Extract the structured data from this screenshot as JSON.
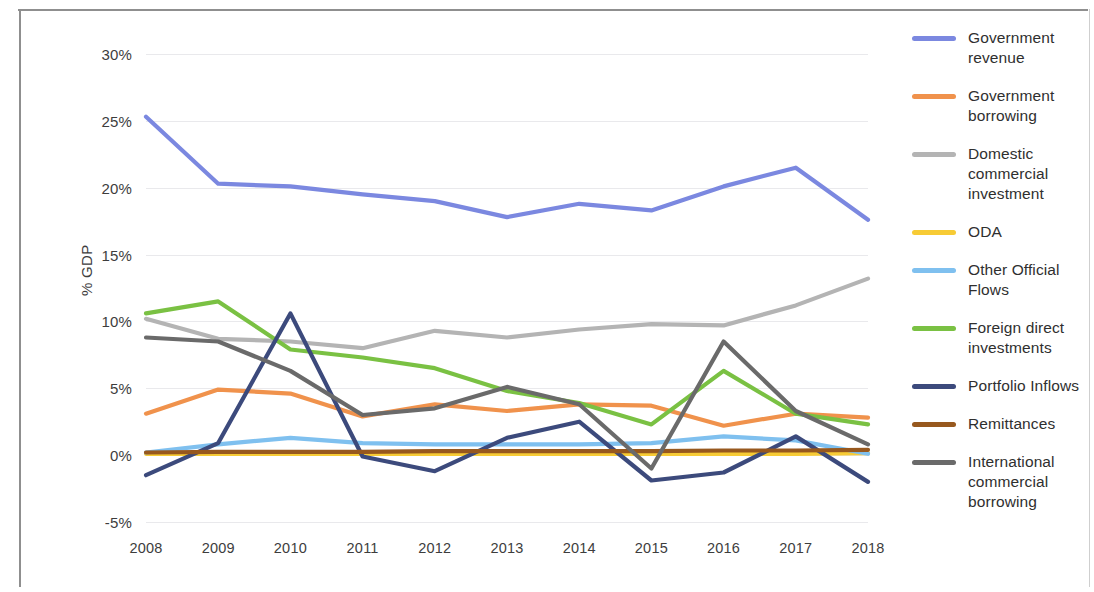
{
  "chart_data": {
    "type": "line",
    "title": "",
    "xlabel": "",
    "ylabel": "% GDP",
    "x": [
      2008,
      2009,
      2010,
      2011,
      2012,
      2013,
      2014,
      2015,
      2016,
      2017,
      2018
    ],
    "xticklabels": [
      "2008",
      "2009",
      "2010",
      "2011",
      "2012",
      "2013",
      "2014",
      "2015",
      "2016",
      "2017",
      "2018"
    ],
    "yticklabels": [
      "30%",
      "25%",
      "20%",
      "15%",
      "10%",
      "5%",
      "0%",
      "-5%"
    ],
    "yticks": [
      30,
      25,
      20,
      15,
      10,
      5,
      0,
      -5
    ],
    "ylim": [
      -5,
      30
    ],
    "grid": true,
    "legend_position": "right",
    "series": [
      {
        "name": "Government revenue",
        "color": "#7b88e0",
        "values": [
          25.3,
          20.3,
          20.1,
          19.5,
          19.0,
          17.8,
          18.8,
          18.3,
          20.1,
          21.5,
          17.6
        ]
      },
      {
        "name": "Government borrowing",
        "color": "#f0924c",
        "values": [
          3.1,
          4.9,
          4.6,
          2.9,
          3.8,
          3.3,
          3.8,
          3.7,
          2.2,
          3.1,
          2.8
        ]
      },
      {
        "name": "Domestic commercial investment",
        "color": "#b4b4b4",
        "values": [
          10.2,
          8.7,
          8.5,
          8.0,
          9.3,
          8.8,
          9.4,
          9.8,
          9.7,
          11.2,
          13.2
        ]
      },
      {
        "name": "ODA",
        "color": "#f7cb35",
        "values": [
          0.1,
          0.1,
          0.1,
          0.1,
          0.1,
          0.1,
          0.1,
          0.1,
          0.1,
          0.1,
          0.15
        ]
      },
      {
        "name": "Other Official Flows",
        "color": "#7fc0ef",
        "values": [
          0.2,
          0.8,
          1.3,
          0.9,
          0.8,
          0.8,
          0.8,
          0.9,
          1.4,
          1.1,
          0.1
        ]
      },
      {
        "name": "Foreign direct investments",
        "color": "#7ac143",
        "values": [
          10.6,
          11.5,
          7.9,
          7.3,
          6.5,
          4.8,
          3.9,
          2.3,
          6.3,
          3.1,
          2.3
        ]
      },
      {
        "name": "Portfolio Inflows",
        "color": "#3c4a7c",
        "values": [
          -1.5,
          0.9,
          10.6,
          -0.1,
          -1.2,
          1.3,
          2.5,
          -1.9,
          -1.3,
          1.4,
          -2.0
        ]
      },
      {
        "name": "Remittances",
        "color": "#97581e",
        "values": [
          0.2,
          0.25,
          0.25,
          0.25,
          0.3,
          0.3,
          0.3,
          0.3,
          0.35,
          0.35,
          0.4
        ]
      },
      {
        "name": "International commercial borrowing",
        "color": "#6a6a6a",
        "values": [
          8.8,
          8.5,
          6.3,
          3.0,
          3.5,
          5.1,
          3.8,
          -1.0,
          8.5,
          3.3,
          0.8
        ]
      }
    ]
  },
  "axis": {
    "y_label": "% GDP"
  },
  "legend": {
    "items": [
      {
        "label": "Government revenue",
        "color": "#7b88e0"
      },
      {
        "label": "Government borrowing",
        "color": "#f0924c"
      },
      {
        "label": "Domestic commercial investment",
        "color": "#b4b4b4"
      },
      {
        "label": "ODA",
        "color": "#f7cb35"
      },
      {
        "label": "Other Official Flows",
        "color": "#7fc0ef"
      },
      {
        "label": "Foreign direct investments",
        "color": "#7ac143"
      },
      {
        "label": "Portfolio Inflows",
        "color": "#3c4a7c"
      },
      {
        "label": "Remittances",
        "color": "#97581e"
      },
      {
        "label": "International commercial borrowing",
        "color": "#6a6a6a"
      }
    ]
  }
}
